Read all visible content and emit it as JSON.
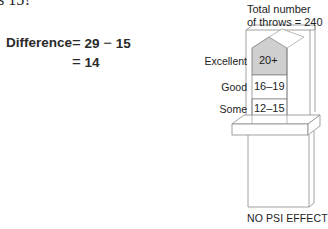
{
  "question_fragment": "s 15?",
  "equation": {
    "label": "Difference",
    "line1": {
      "op": "=",
      "a": "29",
      "minus": "−",
      "b": "15"
    },
    "line2": {
      "op": "=",
      "result": "14"
    }
  },
  "figure": {
    "total_label_line1": "Total number",
    "total_label_line2": "of throws = 240",
    "rows": [
      {
        "label": "Excellent",
        "range": "20+",
        "shaded": true
      },
      {
        "label": "Good",
        "range": "16–19",
        "shaded": false
      },
      {
        "label": "Some",
        "range": "12–15",
        "shaded": false
      }
    ],
    "footer": "NO PSI EFFECT",
    "colors": {
      "shaded_cell": "#cfcfcf",
      "line": "#8a8a8a"
    }
  }
}
